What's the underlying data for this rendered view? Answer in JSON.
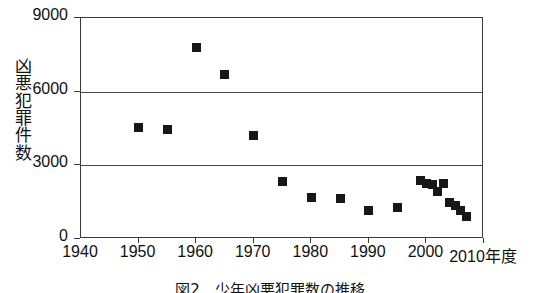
{
  "figure": {
    "caption": "図2　少年凶悪犯罪数の推移"
  },
  "axis": {
    "y_label_chars": [
      "凶",
      "悪",
      "犯",
      "罪",
      "件",
      "数"
    ],
    "y_label_text": "凶悪犯罪件数",
    "y_ticks": [
      "0",
      "3000",
      "6000",
      "9000"
    ],
    "x_ticks": [
      "1940",
      "1950",
      "1960",
      "1970",
      "1980",
      "1990",
      "2000",
      "2010年度"
    ],
    "x_unit_suffix": "年度"
  },
  "chart_data": {
    "type": "scatter",
    "title": "図2　少年凶悪犯罪数の推移",
    "xlabel": "年度",
    "ylabel": "凶悪犯罪件数",
    "xlim": [
      1940,
      2010
    ],
    "ylim": [
      0,
      9000
    ],
    "grid": true,
    "grid_values": [
      3000,
      6000
    ],
    "legend": "none",
    "marker": "filled-square",
    "marker_color": "#171717",
    "x": [
      1950,
      1955,
      1960,
      1965,
      1970,
      1975,
      1980,
      1985,
      1990,
      1995,
      1999,
      2000,
      2001,
      2002,
      2003,
      2004,
      2005,
      2006,
      2007
    ],
    "values": [
      4550,
      4450,
      7800,
      6700,
      4200,
      2350,
      1700,
      1650,
      1150,
      1300,
      2400,
      2250,
      2200,
      1950,
      2250,
      1500,
      1350,
      1150,
      900
    ],
    "points": [
      {
        "x": 1950,
        "y": 4550
      },
      {
        "x": 1955,
        "y": 4450
      },
      {
        "x": 1960,
        "y": 7800
      },
      {
        "x": 1965,
        "y": 6700
      },
      {
        "x": 1970,
        "y": 4200
      },
      {
        "x": 1975,
        "y": 2350
      },
      {
        "x": 1980,
        "y": 1700
      },
      {
        "x": 1985,
        "y": 1650
      },
      {
        "x": 1990,
        "y": 1150
      },
      {
        "x": 1995,
        "y": 1300
      },
      {
        "x": 1999,
        "y": 2400
      },
      {
        "x": 2000,
        "y": 2250
      },
      {
        "x": 2001,
        "y": 2200
      },
      {
        "x": 2002,
        "y": 1950
      },
      {
        "x": 2003,
        "y": 2250
      },
      {
        "x": 2004,
        "y": 1500
      },
      {
        "x": 2005,
        "y": 1350
      },
      {
        "x": 2006,
        "y": 1150
      },
      {
        "x": 2007,
        "y": 900
      }
    ]
  }
}
